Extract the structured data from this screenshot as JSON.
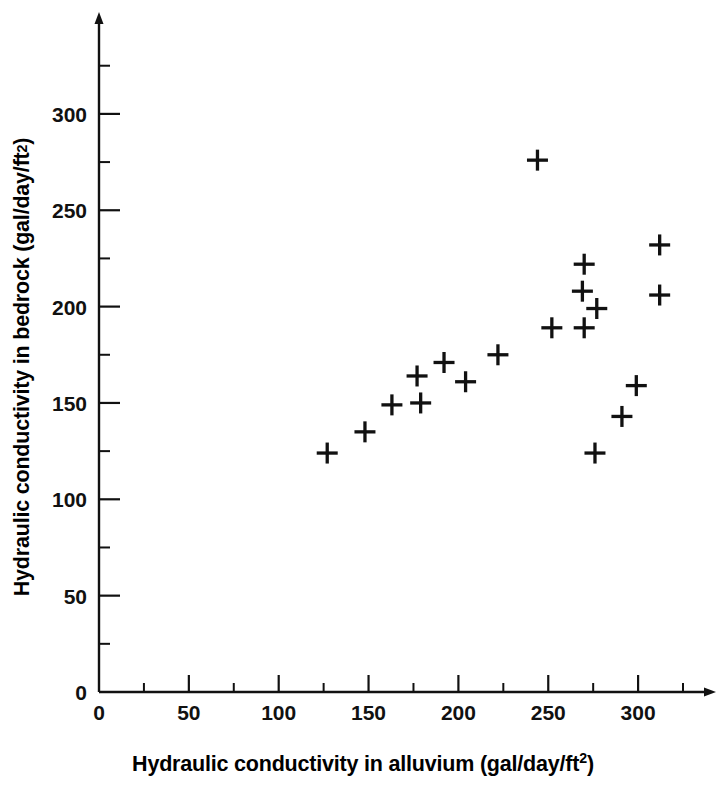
{
  "chart_data": {
    "type": "scatter",
    "title": "",
    "xlabel": "Hydraulic conductivity in alluvium (gal/day/ft2)",
    "ylabel": "Hydraulic conductivity in bedrock (gal/day/ft2)",
    "xlabel_base": "Hydraulic conductivity in alluvium (gal/day/ft",
    "xlabel_sup": "2",
    "xlabel_tail": ")",
    "ylabel_base": "Hydraulic conductivity in bedrock (gal/day/ft",
    "ylabel_sup": "2",
    "ylabel_tail": ")",
    "xlim": [
      0,
      330
    ],
    "ylim": [
      0,
      330
    ],
    "xticks": [
      0,
      50,
      100,
      150,
      200,
      250,
      300
    ],
    "yticks": [
      0,
      50,
      100,
      150,
      200,
      250,
      300
    ],
    "xtick_labels": [
      "0",
      "50",
      "100",
      "150",
      "200",
      "250",
      "300"
    ],
    "ytick_labels": [
      "0",
      "50",
      "100",
      "150",
      "200",
      "250",
      "300"
    ],
    "xminorticks": [
      25,
      75,
      125,
      175,
      225,
      275,
      325
    ],
    "yminorticks": [
      25,
      75,
      125,
      175,
      225,
      275,
      325
    ],
    "grid": false,
    "legend": false,
    "marker": "plus",
    "marker_color": "#111111",
    "points": [
      {
        "x": 127,
        "y": 124
      },
      {
        "x": 148,
        "y": 135
      },
      {
        "x": 163,
        "y": 149
      },
      {
        "x": 179,
        "y": 150
      },
      {
        "x": 177,
        "y": 164
      },
      {
        "x": 192,
        "y": 171
      },
      {
        "x": 204,
        "y": 161
      },
      {
        "x": 222,
        "y": 175
      },
      {
        "x": 244,
        "y": 276
      },
      {
        "x": 252,
        "y": 189
      },
      {
        "x": 270,
        "y": 222
      },
      {
        "x": 270,
        "y": 189
      },
      {
        "x": 269,
        "y": 208
      },
      {
        "x": 277,
        "y": 199
      },
      {
        "x": 276,
        "y": 124
      },
      {
        "x": 291,
        "y": 143
      },
      {
        "x": 299,
        "y": 159
      },
      {
        "x": 312,
        "y": 232
      },
      {
        "x": 312,
        "y": 206
      }
    ]
  },
  "axes": {
    "x_axis_name": "x-axis",
    "y_axis_name": "y-axis"
  }
}
